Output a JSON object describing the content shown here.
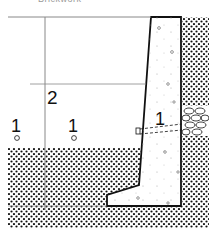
{
  "caption": "Brickwork",
  "labels": {
    "left_one": "1",
    "mid_one": "1",
    "wall_one": "1",
    "height_two": "2"
  },
  "colors": {
    "line": "#111111",
    "guide": "#888888",
    "soil_dot": "#111111",
    "background": "#ffffff"
  }
}
